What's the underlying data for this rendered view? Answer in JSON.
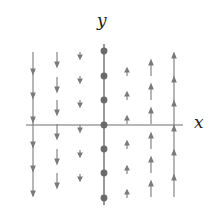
{
  "figure": {
    "type": "phase-line vector field",
    "axes": {
      "x_label": "x",
      "y_label": "y"
    },
    "colors": {
      "axis": "#6e6e6e",
      "arrow": "#7a7a7a",
      "equilibrium_dot": "#6a6a6a",
      "label": "#222222"
    },
    "equilibria": {
      "description": "column of fixed points along the y-axis (x = 0)",
      "x_column": 0,
      "y_positions": [
        3,
        2,
        1,
        0,
        -1,
        -2,
        -3
      ]
    },
    "vector_columns": [
      {
        "x": -3,
        "direction": "down",
        "relative_length": "long"
      },
      {
        "x": -2,
        "direction": "down",
        "relative_length": "medium"
      },
      {
        "x": -1,
        "direction": "down",
        "relative_length": "short"
      },
      {
        "x": 1,
        "direction": "up",
        "relative_length": "short"
      },
      {
        "x": 2,
        "direction": "up",
        "relative_length": "medium"
      },
      {
        "x": 3,
        "direction": "up",
        "relative_length": "long"
      }
    ]
  }
}
